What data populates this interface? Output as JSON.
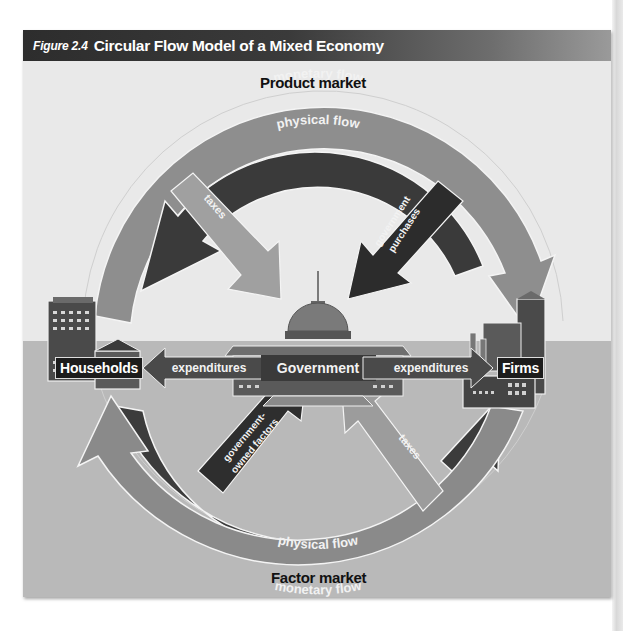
{
  "figure": {
    "number": "Figure 2.4",
    "title": "Circular Flow Model of a Mixed Economy"
  },
  "markets": {
    "top": "Product market",
    "bottom": "Factor market"
  },
  "nodes": {
    "households": "Households",
    "government": "Government",
    "firms": "Firms"
  },
  "flows": {
    "top_outer": "monetary flow",
    "top_inner": "physical flow",
    "bottom_inner": "physical flow",
    "bottom_outer": "monetary flow",
    "taxes_households": "taxes",
    "government_purchases_1": "government",
    "government_purchases_2": "purchases",
    "government_owned_1": "government-",
    "government_owned_2": "owned factors",
    "taxes_firms": "taxes",
    "expenditures_households": "expenditures",
    "expenditures_firms": "expenditures"
  },
  "colors": {
    "title_bar": "#2d2d2d",
    "sky": "#e9e9e9",
    "ground": "#b9b9b9",
    "monetary_arc": "#8c8c8c",
    "physical_arc": "#3a3a3a",
    "tax_arrow": "#9a9a9a",
    "purchase_arrow": "#2a2a2a"
  }
}
